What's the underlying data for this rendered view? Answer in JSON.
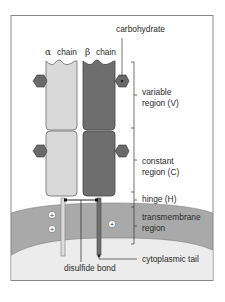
{
  "diagram": {
    "colors": {
      "frame": "#8a8a8a",
      "alpha_chain": "#d9d9d9",
      "beta_chain": "#6e6e6e",
      "carbohydrate": "#6a6a6a",
      "membrane": "#a9a9a9",
      "cytoplasm": "#ececec",
      "outline": "#4a4a4a"
    },
    "chains": {
      "alpha": {
        "symbol": "α",
        "label": "chain"
      },
      "beta": {
        "symbol": "β",
        "label": "chain"
      }
    },
    "labels": {
      "carbohydrate": "carbohydrate",
      "variable_line1": "variable",
      "variable_line2": "region (V)",
      "constant_line1": "constant",
      "constant_line2": "region (C)",
      "hinge": "hinge (H)",
      "transmembrane_line1": "transmembrane",
      "transmembrane_line2": "region",
      "cytoplasmic_tail": "cytoplasmic tail",
      "disulfide_bond": "disulfide bond"
    },
    "charges": [
      "+",
      "+",
      "+"
    ]
  }
}
